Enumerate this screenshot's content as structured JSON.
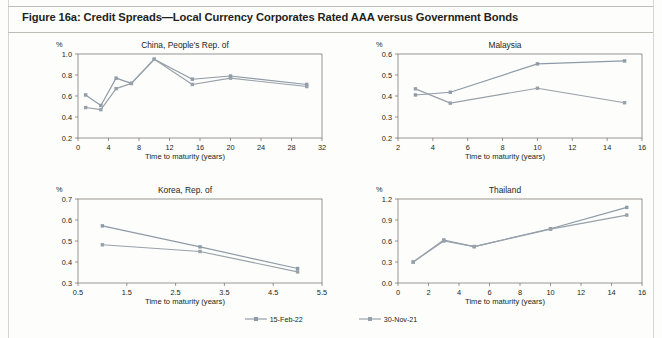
{
  "figure": {
    "title": "Figure 16a: Credit Spreads—Local Currency Corporates Rated AAA versus Government Bonds",
    "axis_title": "Time to maturity (years)",
    "unit_label": "%"
  },
  "legend": {
    "items": [
      {
        "label": "15-Feb-22",
        "color": "#8e9aa6"
      },
      {
        "label": "30-Nov-21",
        "color": "#97a1a9"
      }
    ]
  },
  "colors": {
    "series_1": "#8e9aa6",
    "series_2": "#97a1a9",
    "axis": "#6d6a66",
    "text": "#231f20",
    "page_background": "#fdfdfb",
    "rule": "#bdbbb5"
  },
  "chart_data": [
    {
      "type": "line",
      "title": "China, People's Rep. of",
      "xlabel": "Time to maturity (years)",
      "ylabel": "%",
      "xlim": [
        0,
        32
      ],
      "ylim": [
        0.2,
        1.0
      ],
      "xticks": [
        0,
        4,
        8,
        12,
        16,
        20,
        24,
        28,
        32
      ],
      "yticks": [
        0.2,
        0.4,
        0.6,
        0.8,
        1.0
      ],
      "ytick_labels": [
        "0.2",
        "0.4",
        "0.6",
        "0.8",
        "1.0"
      ],
      "xtick_labels": [
        "0",
        "4",
        "8",
        "12",
        "16",
        "20",
        "24",
        "28",
        "32"
      ],
      "grid": false,
      "x": [
        1,
        3,
        5,
        7,
        10,
        15,
        20,
        30
      ],
      "series": [
        {
          "name": "15-Feb-22",
          "values": [
            0.61,
            0.51,
            0.77,
            0.72,
            0.95,
            0.76,
            0.79,
            0.71
          ]
        },
        {
          "name": "30-Nov-21",
          "values": [
            0.49,
            0.47,
            0.67,
            0.72,
            0.95,
            0.71,
            0.77,
            0.69
          ]
        }
      ]
    },
    {
      "type": "line",
      "title": "Malaysia",
      "xlabel": "Time to maturity (years)",
      "ylabel": "%",
      "xlim": [
        2,
        16
      ],
      "ylim": [
        0.2,
        0.6
      ],
      "xticks": [
        2,
        4,
        6,
        8,
        10,
        12,
        14,
        16
      ],
      "yticks": [
        0.2,
        0.3,
        0.4,
        0.5,
        0.6
      ],
      "ytick_labels": [
        "0.2",
        "0.3",
        "0.4",
        "0.5",
        "0.6"
      ],
      "xtick_labels": [
        "2",
        "4",
        "6",
        "8",
        "10",
        "12",
        "14",
        "16"
      ],
      "grid": false,
      "x": [
        3,
        5,
        10,
        15
      ],
      "series": [
        {
          "name": "15-Feb-22",
          "values": [
            0.405,
            0.418,
            0.553,
            0.567
          ]
        },
        {
          "name": "30-Nov-21",
          "values": [
            0.434,
            0.366,
            0.437,
            0.368
          ]
        }
      ]
    },
    {
      "type": "line",
      "title": "Korea, Rep. of",
      "xlabel": "Time to maturity (years)",
      "ylabel": "%",
      "xlim": [
        0.5,
        5.5
      ],
      "ylim": [
        0.3,
        0.7
      ],
      "xticks": [
        0.5,
        1.5,
        2.5,
        3.5,
        4.5,
        5.5
      ],
      "yticks": [
        0.3,
        0.4,
        0.5,
        0.6,
        0.7
      ],
      "ytick_labels": [
        "0.3",
        "0.4",
        "0.5",
        "0.6",
        "0.7"
      ],
      "xtick_labels": [
        "0.5",
        "1.5",
        "2.5",
        "3.5",
        "4.5",
        "5.5"
      ],
      "grid": false,
      "x": [
        1,
        3,
        5
      ],
      "series": [
        {
          "name": "15-Feb-22",
          "values": [
            0.572,
            0.472,
            0.369
          ]
        },
        {
          "name": "30-Nov-21",
          "values": [
            0.482,
            0.45,
            0.353
          ]
        }
      ]
    },
    {
      "type": "line",
      "title": "Thailand",
      "xlabel": "Time to maturity (years)",
      "ylabel": "%",
      "xlim": [
        0,
        16
      ],
      "ylim": [
        0.0,
        1.2
      ],
      "xticks": [
        0,
        2,
        4,
        6,
        8,
        10,
        12,
        14,
        16
      ],
      "yticks": [
        0.0,
        0.3,
        0.6,
        0.9,
        1.2
      ],
      "ytick_labels": [
        "0.0",
        "0.3",
        "0.6",
        "0.9",
        "1.2"
      ],
      "xtick_labels": [
        "0",
        "2",
        "4",
        "6",
        "8",
        "10",
        "12",
        "14",
        "16"
      ],
      "grid": false,
      "x": [
        1,
        3,
        5,
        10,
        15
      ],
      "series": [
        {
          "name": "15-Feb-22",
          "values": [
            0.3,
            0.615,
            0.52,
            0.775,
            1.08
          ]
        },
        {
          "name": "30-Nov-21",
          "values": [
            0.3,
            0.6,
            0.52,
            0.77,
            0.97
          ]
        }
      ]
    }
  ]
}
